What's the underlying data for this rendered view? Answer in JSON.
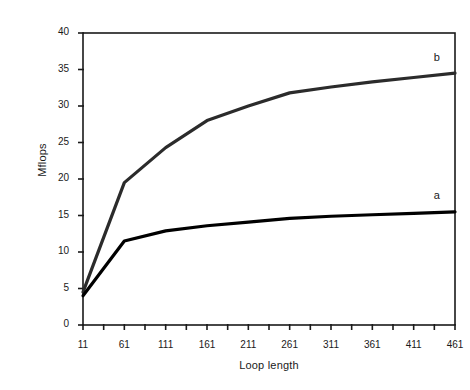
{
  "chart_data": {
    "type": "line",
    "title": "",
    "xlabel": "Loop length",
    "ylabel": "Mflops",
    "xlim": [
      11,
      461
    ],
    "ylim": [
      0,
      40
    ],
    "grid": false,
    "legend_position": "inline-right",
    "x_ticks": [
      11,
      61,
      111,
      161,
      211,
      261,
      311,
      361,
      411,
      461
    ],
    "x_tick_labels": [
      "11",
      "61",
      "111",
      "161",
      "211",
      "261",
      "311",
      "361",
      "411",
      "461"
    ],
    "x_minor_tick_step": 25,
    "y_ticks": [
      0,
      5,
      10,
      15,
      20,
      25,
      30,
      35,
      40
    ],
    "y_tick_labels": [
      "0",
      "5",
      "10",
      "15",
      "20",
      "25",
      "30",
      "35",
      "40"
    ],
    "x": [
      11,
      61,
      111,
      161,
      211,
      261,
      311,
      361,
      411,
      461
    ],
    "series": [
      {
        "name": "b",
        "label": "b",
        "color": "#2b2b2b",
        "width": 3.2,
        "values": [
          4.5,
          19.5,
          24.3,
          28.0,
          30.0,
          31.8,
          32.6,
          33.3,
          33.9,
          34.5
        ]
      },
      {
        "name": "a",
        "label": "a",
        "color": "#000000",
        "width": 3.2,
        "values": [
          4.0,
          11.5,
          12.9,
          13.6,
          14.1,
          14.6,
          14.9,
          15.1,
          15.3,
          15.5
        ]
      }
    ],
    "annotations": [
      {
        "text": "b",
        "x": 440,
        "y": 36.5
      },
      {
        "text": "a",
        "x": 440,
        "y": 17.5
      }
    ]
  },
  "axis": {
    "y_title": "Mflops",
    "x_title": "Loop length"
  }
}
